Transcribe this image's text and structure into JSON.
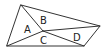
{
  "diagram": {
    "type": "geometric-partition",
    "stroke_color": "#333333",
    "vertices": {
      "top": [
        21,
        5
      ],
      "right": [
        100,
        26
      ],
      "bottom_right": [
        84,
        46
      ],
      "bottom_left": [
        7,
        46
      ],
      "interior": [
        43,
        31
      ]
    },
    "regions": [
      {
        "label": "A",
        "x": 26,
        "y": 29
      },
      {
        "label": "B",
        "x": 42,
        "y": 22
      },
      {
        "label": "C",
        "x": 42,
        "y": 42
      },
      {
        "label": "D",
        "x": 76,
        "y": 39
      }
    ]
  }
}
